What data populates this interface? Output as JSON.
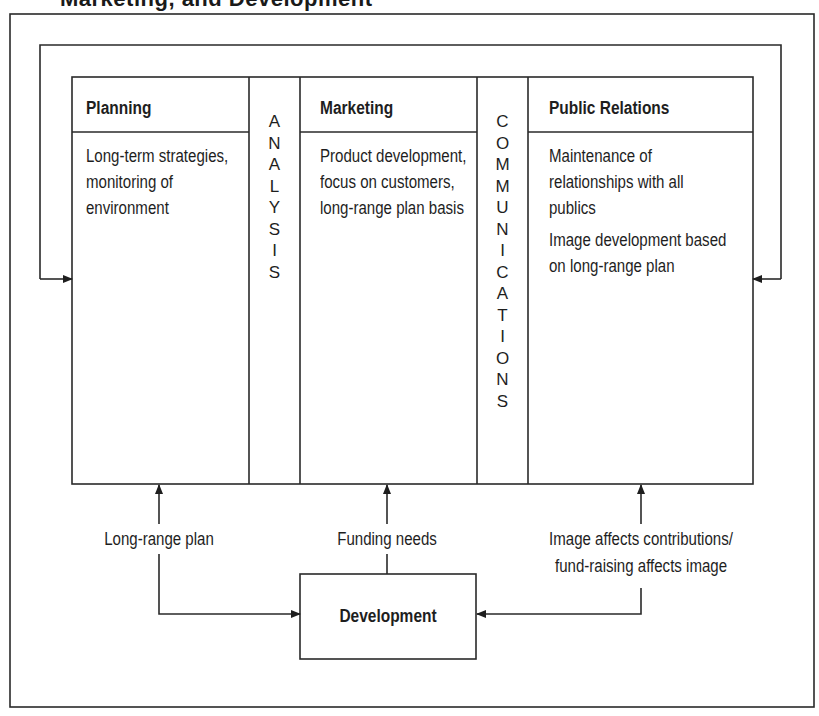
{
  "title": "Marketing, and Development",
  "columns": {
    "planning": {
      "heading": "Planning",
      "paragraphs": [
        "Long-term strategies, monitoring of environment"
      ]
    },
    "analysis": {
      "letters": [
        "A",
        "N",
        "A",
        "L",
        "Y",
        "S",
        "I",
        "S"
      ]
    },
    "marketing": {
      "heading": "Marketing",
      "paragraphs": [
        "Product development, focus on customers, long-range plan basis"
      ]
    },
    "communications": {
      "letters": [
        "C",
        "O",
        "M",
        "M",
        "U",
        "N",
        "I",
        "C",
        "A",
        "T",
        "I",
        "O",
        "N",
        "S"
      ]
    },
    "public_relations": {
      "heading": "Public Relations",
      "paragraphs": [
        "Maintenance of relationships with all publics",
        "Image development based on long-range plan"
      ]
    }
  },
  "flows": {
    "long_range_plan": "Long-range plan",
    "funding_needs": "Funding needs",
    "image_line1": "Image affects contributions/",
    "image_line2": "fund-raising affects image"
  },
  "development": {
    "label": "Development"
  }
}
